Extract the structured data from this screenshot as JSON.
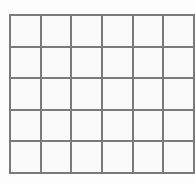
{
  "grid": {
    "rows": 5,
    "columns": 6,
    "line_color": "#7a7a7a",
    "cell_color": "#fafafa",
    "cells": [
      [
        "",
        "",
        "",
        "",
        "",
        ""
      ],
      [
        "",
        "",
        "",
        "",
        "",
        ""
      ],
      [
        "",
        "",
        "",
        "",
        "",
        ""
      ],
      [
        "",
        "",
        "",
        "",
        "",
        ""
      ],
      [
        "",
        "",
        "",
        "",
        "",
        ""
      ]
    ]
  }
}
